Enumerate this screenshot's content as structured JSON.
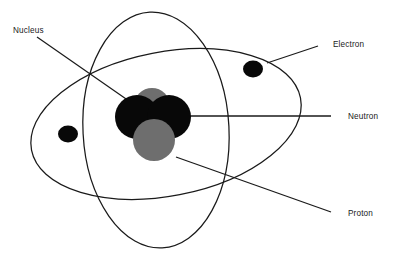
{
  "diagram": {
    "background_color": "#ffffff",
    "line_color": "#1a1a1a",
    "labels": {
      "nucleus": "Nucleus",
      "electron": "Electron",
      "neutron": "Neutron",
      "proton": "Proton"
    },
    "particles": {
      "neutron_color": "#080808",
      "proton_color": "#6e6e6e",
      "electron_color": "#080808",
      "electron_count": 2,
      "neutron_count": 2,
      "proton_count": 2
    },
    "orbits": {
      "count": 2,
      "orbit_1_description": "tall narrow vertical ellipse",
      "orbit_2_description": "wide tilted ellipse"
    }
  }
}
